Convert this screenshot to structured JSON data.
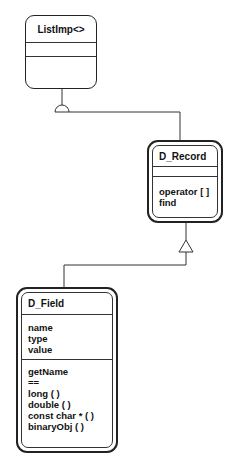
{
  "classes": {
    "listimp": {
      "name": "ListImp<>",
      "attributes": [],
      "operations": []
    },
    "d_record": {
      "name": "D_Record",
      "attributes": [],
      "operations": [
        "operator [ ]",
        "find"
      ]
    },
    "d_field": {
      "name": "D_Field",
      "attributes": [
        "name",
        "type",
        "value"
      ],
      "operations": [
        "getName",
        "==",
        "long ( )",
        "double ( )",
        "const char * ( )",
        "binaryObj ( )"
      ]
    }
  },
  "relations": [
    {
      "from": "ListImp<>",
      "to": "D_Record",
      "type": "uses-interface"
    },
    {
      "from": "D_Field",
      "to": "D_Record",
      "type": "inheritance"
    }
  ]
}
